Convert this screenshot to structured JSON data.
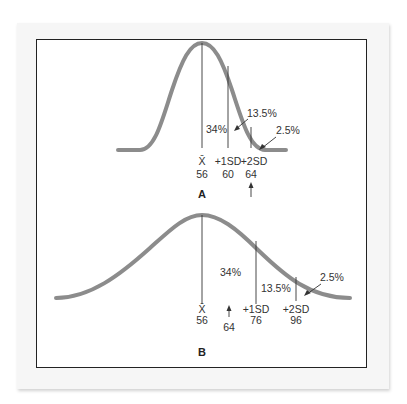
{
  "figure": {
    "panel_a": {
      "label": "A",
      "mean_symbol": "X̄",
      "markers": [
        {
          "name": "X̄",
          "value": "56"
        },
        {
          "name": "+1SD",
          "value": "60"
        },
        {
          "name": "+2SD",
          "value": "64"
        }
      ],
      "percent_34": "34%",
      "percent_13_5": "13.5%",
      "percent_2_5": "2.5%",
      "arrow_value": ""
    },
    "panel_b": {
      "label": "B",
      "markers": [
        {
          "name": "X̄",
          "value": "56"
        },
        {
          "name": "+1SD",
          "value": "76"
        },
        {
          "name": "+2SD",
          "value": "96"
        }
      ],
      "arrow_value": "64",
      "percent_34": "34%",
      "percent_13_5": "13.5%",
      "percent_2_5": "2.5%"
    },
    "colors": {
      "curve": "#8c8c8c",
      "lines": "#333333",
      "frame": "#222222"
    }
  }
}
